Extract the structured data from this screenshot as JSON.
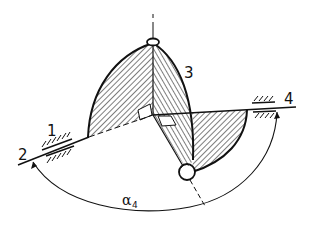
{
  "diagram": {
    "type": "spherical-mechanism-kinematic-sketch",
    "labels": {
      "frame_bearing": "1",
      "input_shaft": "2",
      "coupler_link": "3",
      "output_shaft": "4",
      "angle_symbol": "α",
      "angle_subscript": "4"
    },
    "colors": {
      "line": "#111111",
      "background": "#ffffff"
    }
  }
}
